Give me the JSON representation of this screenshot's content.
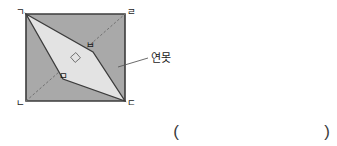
{
  "figure": {
    "name": "square-with-inscribed-pond-quadrilateral",
    "colors": {
      "square_fill": "#a9a9a9",
      "pond_fill": "#e3e3e3",
      "outline": "#3c3c3c",
      "diagonal": "#6e6e6e",
      "page_bg": "#ffffff",
      "text": "#1a1a1a"
    },
    "square": {
      "name": "square-gnd-r",
      "corners": [
        {
          "key": "top_left",
          "label": "ㄱ",
          "x": 26,
          "y": 14,
          "label_x": 20,
          "label_y": 12
        },
        {
          "key": "top_right",
          "label": "ㄹ",
          "x": 125,
          "y": 14,
          "label_x": 129,
          "label_y": 12
        },
        {
          "key": "bottom_right",
          "label": "ㄷ",
          "x": 125,
          "y": 101,
          "label_x": 129,
          "label_y": 106
        },
        {
          "key": "bottom_left",
          "label": "ㄴ",
          "x": 26,
          "y": 101,
          "label_x": 19,
          "label_y": 106
        }
      ]
    },
    "pond": {
      "name": "pond-quadrilateral",
      "label": "연못",
      "label_x": 152,
      "label_y": 62,
      "vertices": [
        {
          "key": "g",
          "label": "ㄱ",
          "x": 26,
          "y": 14
        },
        {
          "key": "b",
          "label": "ㅂ",
          "x": 93,
          "y": 52,
          "label_x": 88,
          "label_y": 46
        },
        {
          "key": "d",
          "label": "ㄷ",
          "x": 125,
          "y": 101
        },
        {
          "key": "m",
          "label": "ㅁ",
          "x": 63,
          "y": 79,
          "label_x": 62,
          "label_y": 76
        }
      ],
      "leader_line": {
        "x1": 118,
        "y1": 67,
        "x2": 148,
        "y2": 58
      }
    },
    "right_angle_marker": {
      "name": "right-angle-marker",
      "x": 75.5,
      "y": 57.5,
      "size": 7
    },
    "answer_blank": {
      "name": "answer-parentheses",
      "open": "(",
      "close": ")",
      "open_x": 176,
      "open_y": 137,
      "close_x": 327,
      "close_y": 137
    }
  }
}
